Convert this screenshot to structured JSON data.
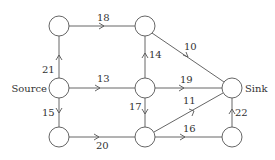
{
  "diagram": {
    "type": "flow-network",
    "colors": {
      "stroke": "#555555",
      "text": "#333333",
      "background": "#ffffff"
    },
    "nodes": [
      {
        "id": "a",
        "label": "",
        "x": 59,
        "y": 26
      },
      {
        "id": "b",
        "label": "",
        "x": 145,
        "y": 26
      },
      {
        "id": "source",
        "label": "Source",
        "x": 59,
        "y": 88
      },
      {
        "id": "c",
        "label": "",
        "x": 145,
        "y": 88
      },
      {
        "id": "sink",
        "label": "Sink",
        "x": 232,
        "y": 88
      },
      {
        "id": "d",
        "label": "",
        "x": 59,
        "y": 137
      },
      {
        "id": "e",
        "label": "",
        "x": 145,
        "y": 137
      },
      {
        "id": "f",
        "label": "",
        "x": 232,
        "y": 137
      }
    ],
    "edges": [
      {
        "from": "source",
        "to": "a",
        "capacity": "21"
      },
      {
        "from": "a",
        "to": "b",
        "capacity": "18"
      },
      {
        "from": "b",
        "to": "sink",
        "capacity": "10"
      },
      {
        "from": "source",
        "to": "c",
        "capacity": "13"
      },
      {
        "from": "c",
        "to": "b",
        "capacity": "14"
      },
      {
        "from": "c",
        "to": "sink",
        "capacity": "19"
      },
      {
        "from": "source",
        "to": "d",
        "capacity": "15"
      },
      {
        "from": "c",
        "to": "e",
        "capacity": "17"
      },
      {
        "from": "d",
        "to": "e",
        "capacity": "20"
      },
      {
        "from": "e",
        "to": "sink",
        "capacity": "11"
      },
      {
        "from": "e",
        "to": "f",
        "capacity": "16"
      },
      {
        "from": "f",
        "to": "sink",
        "capacity": "22"
      }
    ]
  }
}
